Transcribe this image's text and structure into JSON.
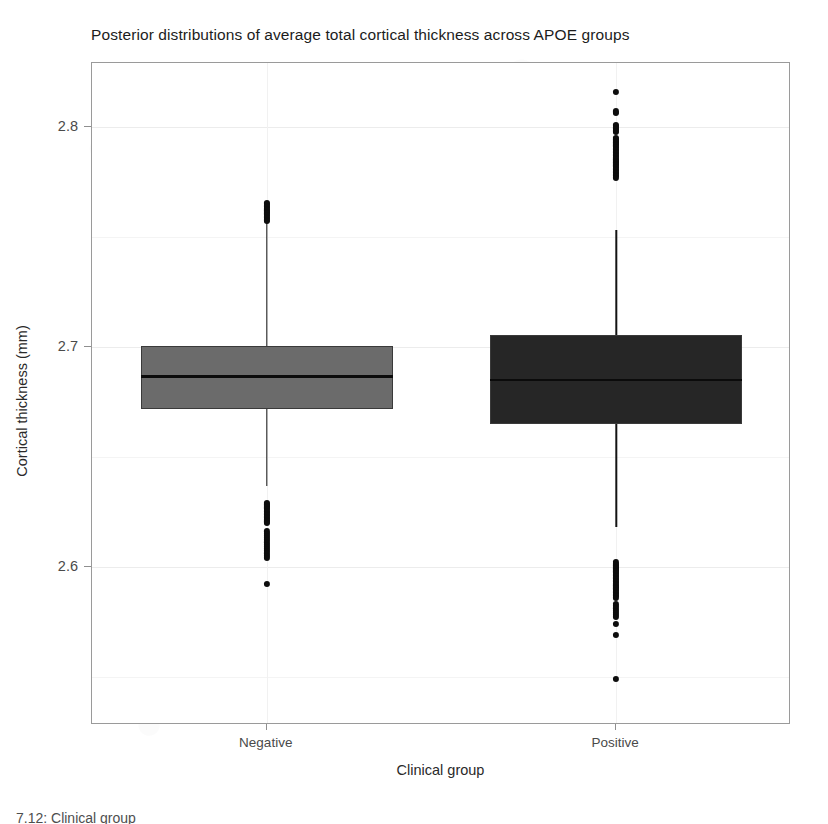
{
  "chart_data": {
    "type": "box",
    "title": "Posterior distributions of average total cortical thickness across APOE groups",
    "xlabel": "Clinical group",
    "ylabel": "Cortical thickness (mm)",
    "categories": [
      "Negative",
      "Positive"
    ],
    "x_tick_labels": [
      "Negative",
      "Positive"
    ],
    "y_tick_labels": [
      "2.6",
      "2.7",
      "2.8"
    ],
    "y_tick_values": [
      2.6,
      2.7,
      2.8
    ],
    "ylim": [
      2.528,
      2.829
    ],
    "grid": true,
    "legend": "none",
    "orientation": "vertical",
    "boxes": [
      {
        "name": "Negative",
        "fill_color": "#6b6b6b",
        "border_color": "#3a3a3a",
        "q1": 2.6715,
        "median": 2.6865,
        "q3": 2.7005,
        "whisker_low": 2.6365,
        "whisker_high": 2.7585,
        "outlier_values": [
          2.7655,
          2.7648,
          2.7641,
          2.7634,
          2.7627,
          2.762,
          2.7613,
          2.7606,
          2.7599,
          2.7592,
          2.7585,
          2.7578,
          2.7571,
          2.629,
          2.6283,
          2.6276,
          2.6269,
          2.6262,
          2.6255,
          2.6248,
          2.6241,
          2.6234,
          2.6227,
          2.622,
          2.6213,
          2.6206,
          2.6199,
          2.616,
          2.615,
          2.614,
          2.613,
          2.612,
          2.611,
          2.61,
          2.609,
          2.608,
          2.607,
          2.606,
          2.605,
          2.604,
          2.592
        ]
      },
      {
        "name": "Positive",
        "fill_color": "#262626",
        "border_color": "#3a3a3a",
        "q1": 2.665,
        "median": 2.6848,
        "q3": 2.7055,
        "whisker_low": 2.618,
        "whisker_high": 2.753,
        "outlier_values": [
          2.816,
          2.807,
          2.8063,
          2.801,
          2.8003,
          2.7996,
          2.7989,
          2.7982,
          2.7975,
          2.795,
          2.7943,
          2.7936,
          2.7929,
          2.7922,
          2.7915,
          2.7908,
          2.7901,
          2.7894,
          2.7887,
          2.788,
          2.7873,
          2.7866,
          2.7859,
          2.7852,
          2.7845,
          2.7838,
          2.7831,
          2.7824,
          2.7817,
          2.781,
          2.7803,
          2.7796,
          2.7789,
          2.7782,
          2.7775,
          2.7768,
          2.602,
          2.6013,
          2.6006,
          2.5999,
          2.5992,
          2.5985,
          2.5978,
          2.5971,
          2.5964,
          2.5957,
          2.595,
          2.5943,
          2.5936,
          2.5929,
          2.5922,
          2.5915,
          2.5908,
          2.5901,
          2.5894,
          2.5887,
          2.588,
          2.5873,
          2.5866,
          2.5859,
          2.583,
          2.582,
          2.581,
          2.58,
          2.579,
          2.578,
          2.577,
          2.574,
          2.569,
          2.549
        ]
      }
    ]
  },
  "caption": {
    "text": "7.12: Clinical group"
  }
}
